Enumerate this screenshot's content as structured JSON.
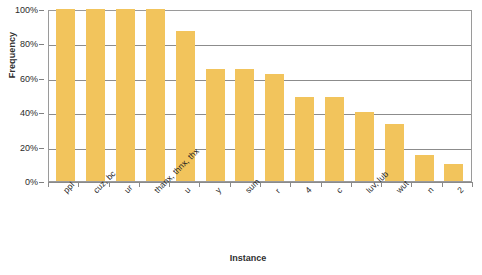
{
  "chart_data": {
    "type": "bar",
    "title": "",
    "xlabel": "Instance",
    "ylabel": "Frequency",
    "categories": [
      "ppl",
      "cuz, bc",
      "ur",
      "thanx, thnx, thx",
      "u",
      "y",
      "sum",
      "r",
      "4",
      "c",
      "luv, lub",
      "wut",
      "n",
      "2"
    ],
    "values": [
      100,
      100,
      100,
      100,
      87,
      65,
      65,
      62,
      49,
      49,
      40,
      33,
      15,
      10
    ],
    "ylim": [
      0,
      100
    ],
    "ytick_labels": [
      "100%",
      "80%",
      "60%",
      "40%",
      "20%",
      "0%"
    ],
    "ytick_values": [
      100,
      80,
      60,
      40,
      20,
      0
    ],
    "grid": true,
    "legend": "none",
    "bar_color": "#f2c45c",
    "gridline_color": "#8c8c8c",
    "axis_color": "#9a9a9a",
    "text_color": "#2b2b2b",
    "background": "#ffffff"
  }
}
